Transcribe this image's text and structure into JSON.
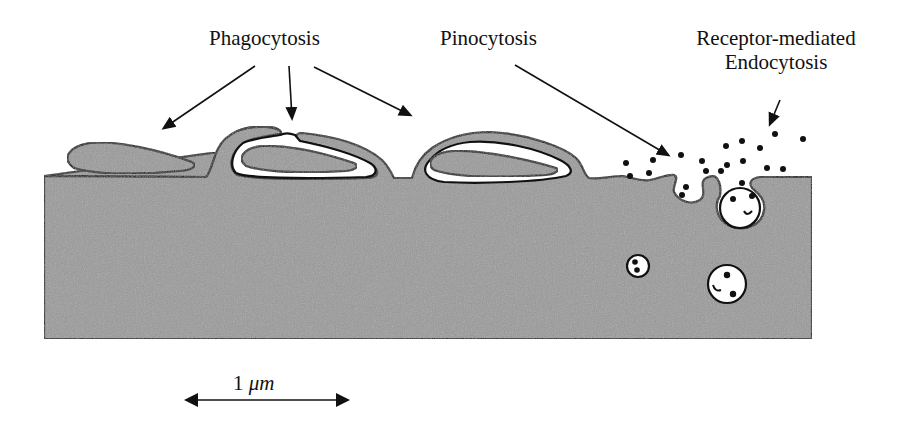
{
  "diagram": {
    "labels": {
      "phagocytosis": "Phagocytosis",
      "pinocytosis": "Pinocytosis",
      "receptor_line1": "Receptor-mediated",
      "receptor_line2": "Endocytosis"
    },
    "scale_bar": {
      "value": "1",
      "unit": "μm"
    },
    "colors": {
      "cytoplasm": "#9a9a9a",
      "outline": "#111111",
      "background": "#ffffff"
    }
  }
}
